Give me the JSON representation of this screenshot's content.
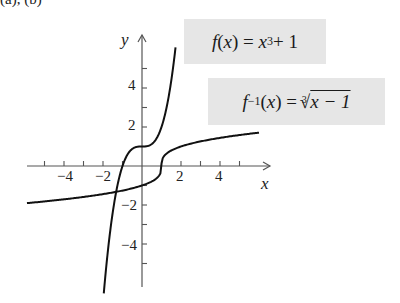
{
  "header": {
    "partial_label": "(a), (b)"
  },
  "labels": {
    "f": {
      "lhs": "f",
      "arg": "(x) = ",
      "base": "x",
      "exp": "3",
      "tail": " + 1",
      "full": "f(x) = x³ + 1"
    },
    "finv": {
      "lhs": "f",
      "sup": "−1",
      "arg": "(x) = ",
      "index": "3",
      "radical": "√",
      "radicand": "x − 1",
      "full": "f⁻¹(x) = ∛(x − 1)"
    }
  },
  "chart_data": {
    "type": "line",
    "title": "",
    "xlabel": "x",
    "ylabel": "y",
    "xlim": [
      -6,
      6.5
    ],
    "ylim": [
      -6.2,
      6.7
    ],
    "grid": false,
    "x_tick_labels": [
      "−4",
      "−2",
      "2",
      "4"
    ],
    "x_ticks": [
      -5,
      -4,
      -3,
      -2,
      -1,
      1,
      2,
      3,
      4,
      5
    ],
    "y_tick_labels": [
      "4",
      "2",
      "−2",
      "−4"
    ],
    "y_ticks": [
      5,
      4,
      3,
      2,
      1,
      -1,
      -2,
      -3,
      -4,
      -5
    ],
    "series": [
      {
        "name": "f(x) = x^3 + 1",
        "x_range": [
          -1.96,
          1.72
        ],
        "points": [
          [
            -1.96,
            -6.5
          ],
          [
            -1.5,
            -2.375
          ],
          [
            -1,
            0
          ],
          [
            -0.5,
            0.875
          ],
          [
            0,
            1
          ],
          [
            0.5,
            1.125
          ],
          [
            1,
            2
          ],
          [
            1.5,
            4.375
          ],
          [
            1.72,
            6.1
          ]
        ]
      },
      {
        "name": "f^-1(x) = cbrt(x - 1)",
        "x_range": [
          -5.9,
          6.0
        ],
        "points": [
          [
            -5.9,
            -1.9
          ],
          [
            -3,
            -1.59
          ],
          [
            -1,
            -1.26
          ],
          [
            0,
            -1
          ],
          [
            0.5,
            -0.79
          ],
          [
            1,
            0
          ],
          [
            1.5,
            0.79
          ],
          [
            2,
            1
          ],
          [
            4,
            1.44
          ],
          [
            6,
            1.71
          ]
        ]
      }
    ],
    "annotations": [
      "f(x) = x^3 + 1",
      "f^-1(x) = cbrt(x - 1)"
    ]
  }
}
